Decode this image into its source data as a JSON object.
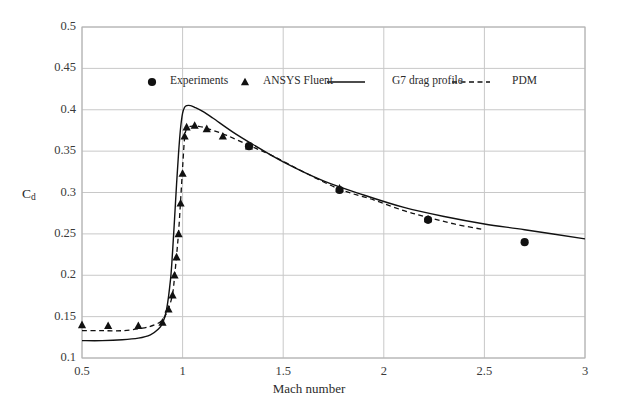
{
  "chart_data": {
    "type": "line",
    "title": "",
    "xlabel": "Mach number",
    "ylabel": "Cd",
    "ylabel_base": "C",
    "ylabel_sub": "d",
    "xlim": [
      0.5,
      3
    ],
    "ylim": [
      0.1,
      0.5
    ],
    "xticks": [
      "0.5",
      "1",
      "1.5",
      "2",
      "2.5",
      "3"
    ],
    "xtick_values": [
      0.5,
      1,
      1.5,
      2,
      2.5,
      3
    ],
    "yticks": [
      "0.1",
      "0.15",
      "0.2",
      "0.25",
      "0.3",
      "0.35",
      "0.4",
      "0.45",
      "0.5"
    ],
    "ytick_values": [
      0.1,
      0.15,
      0.2,
      0.25,
      0.3,
      0.35,
      0.4,
      0.45,
      0.5
    ],
    "grid": true,
    "grid_color": "#c8c8c8",
    "legend_position": "top-center-inside",
    "series": [
      {
        "name": "Experiments",
        "marker": "circle",
        "color": "#111111",
        "x": [
          1.33,
          1.78,
          2.22,
          2.7
        ],
        "values": [
          0.356,
          0.303,
          0.267,
          0.24
        ]
      },
      {
        "name": "ANSYS Fluent",
        "marker": "triangle",
        "color": "#111111",
        "x": [
          0.5,
          0.63,
          0.78,
          0.9,
          0.93,
          0.95,
          0.96,
          0.97,
          0.98,
          0.99,
          1.0,
          1.01,
          1.02,
          1.06,
          1.12,
          1.2,
          1.33,
          1.78,
          2.22
        ],
        "values": [
          0.14,
          0.139,
          0.139,
          0.143,
          0.159,
          0.176,
          0.2,
          0.222,
          0.25,
          0.287,
          0.323,
          0.368,
          0.379,
          0.381,
          0.377,
          0.368,
          0.356,
          0.305,
          0.268
        ]
      },
      {
        "name": "G7 drag profile",
        "marker": "none",
        "line": "solid",
        "color": "#111111",
        "x": [
          0.5,
          0.6,
          0.7,
          0.78,
          0.84,
          0.88,
          0.9,
          0.92,
          0.94,
          0.95,
          0.96,
          0.97,
          0.98,
          0.99,
          1.0,
          1.01,
          1.02,
          1.04,
          1.06,
          1.1,
          1.15,
          1.25,
          1.35,
          1.5,
          1.7,
          1.9,
          2.1,
          2.3,
          2.5,
          2.7,
          3.0
        ],
        "values": [
          0.121,
          0.121,
          0.122,
          0.124,
          0.128,
          0.135,
          0.142,
          0.158,
          0.195,
          0.228,
          0.268,
          0.31,
          0.348,
          0.378,
          0.396,
          0.403,
          0.405,
          0.405,
          0.403,
          0.398,
          0.39,
          0.373,
          0.358,
          0.337,
          0.314,
          0.297,
          0.282,
          0.271,
          0.262,
          0.255,
          0.244
        ]
      },
      {
        "name": "PDM",
        "marker": "none",
        "line": "dashed",
        "color": "#111111",
        "x": [
          0.5,
          0.6,
          0.7,
          0.8,
          0.86,
          0.9,
          0.93,
          0.95,
          0.96,
          0.97,
          0.98,
          0.99,
          1.0,
          1.01,
          1.02,
          1.04,
          1.08,
          1.14,
          1.22,
          1.33,
          1.45,
          1.6,
          1.78,
          1.95,
          2.1,
          2.22,
          2.35,
          2.5
        ],
        "values": [
          0.133,
          0.133,
          0.133,
          0.136,
          0.14,
          0.146,
          0.16,
          0.177,
          0.198,
          0.224,
          0.252,
          0.29,
          0.33,
          0.366,
          0.377,
          0.38,
          0.38,
          0.376,
          0.369,
          0.357,
          0.344,
          0.325,
          0.304,
          0.291,
          0.278,
          0.27,
          0.262,
          0.255
        ]
      }
    ]
  },
  "legend": {
    "items": [
      {
        "label": "Experiments",
        "marker": "circle"
      },
      {
        "label": "ANSYS Fluent",
        "marker": "triangle"
      },
      {
        "label": "G7 drag profile",
        "marker": "solid-line"
      },
      {
        "label": "PDM",
        "marker": "dashed-line"
      }
    ]
  },
  "axes": {
    "x_title": "Mach number",
    "y_title_base": "C",
    "y_title_sub": "d"
  }
}
